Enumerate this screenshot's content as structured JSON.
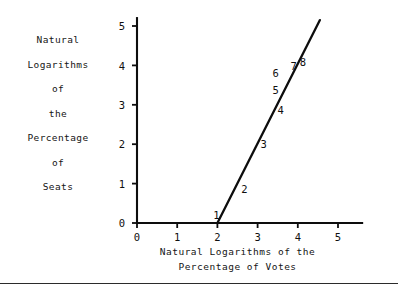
{
  "chart_data": {
    "type": "scatter",
    "title": "",
    "xlabel": "Natural Logarithms of the Percentage of Votes",
    "ylabel": "Natural Logarithms of the Percentage of Seats",
    "xlabel_lines": [
      "Natural Logarithms of the",
      "Percentage of Votes"
    ],
    "ylabel_lines": [
      "Natural",
      "Logarithms",
      "of",
      "the",
      "Percentage",
      "of",
      "Seats"
    ],
    "xlim": [
      0,
      5.6
    ],
    "ylim": [
      0,
      5.2
    ],
    "xticks": [
      0,
      1,
      2,
      3,
      4,
      5
    ],
    "yticks": [
      0,
      1,
      2,
      3,
      4,
      5
    ],
    "xtick_labels": [
      "0",
      "1",
      "2",
      "3",
      "4",
      "5"
    ],
    "ytick_labels": [
      "0",
      "1",
      "2",
      "3",
      "4",
      "5"
    ],
    "grid": false,
    "legend": false,
    "point_labels": [
      "1",
      "2",
      "3",
      "4",
      "5",
      "6",
      "7",
      "8"
    ],
    "points": [
      {
        "label": "1",
        "x": 2.0,
        "y": 0.0
      },
      {
        "label": "2",
        "x": 2.45,
        "y": 0.95
      },
      {
        "label": "3",
        "x": 2.95,
        "y": 2.0
      },
      {
        "label": "4",
        "x": 3.35,
        "y": 2.85
      },
      {
        "label": "5",
        "x": 3.6,
        "y": 3.4
      },
      {
        "label": "6",
        "x": 3.6,
        "y": 3.62
      },
      {
        "label": "7",
        "x": 3.82,
        "y": 3.78
      },
      {
        "label": "8",
        "x": 3.95,
        "y": 3.85
      }
    ],
    "fit_line": {
      "x_start": 2.0,
      "y_start": 0.0,
      "x_end": 4.55,
      "y_end": 5.15,
      "slope": 2.02,
      "intercept": -4.04
    }
  },
  "footer": {
    "caption": ""
  }
}
